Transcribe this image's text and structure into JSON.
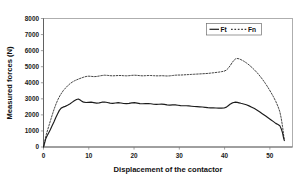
{
  "chart_data": {
    "type": "line",
    "title": "",
    "xlabel": "Displacement of the contactor",
    "ylabel": "Measured forces (N)",
    "xlim": [
      0,
      55
    ],
    "ylim": [
      0,
      8000
    ],
    "xticks": [
      0,
      10,
      20,
      30,
      40,
      50
    ],
    "xtick_labels": [
      "0",
      "10",
      "20",
      "30",
      "40",
      "50"
    ],
    "yticks": [
      0,
      1000,
      2000,
      3000,
      4000,
      5000,
      6000,
      7000,
      8000
    ],
    "ytick_labels": [
      "0",
      "1000",
      "2000",
      "3000",
      "4000",
      "5000",
      "6000",
      "7000",
      "8000"
    ],
    "grid": false,
    "legend_position": "top-right",
    "series": [
      {
        "name": "Ft",
        "style": "solid",
        "color": "#1c1c1c",
        "points": [
          [
            0.0,
            0
          ],
          [
            0.25,
            240
          ],
          [
            0.5,
            520
          ],
          [
            0.8,
            700
          ],
          [
            1.1,
            860
          ],
          [
            1.5,
            1080
          ],
          [
            1.9,
            1320
          ],
          [
            2.3,
            1560
          ],
          [
            2.7,
            1820
          ],
          [
            3.1,
            2060
          ],
          [
            3.5,
            2280
          ],
          [
            3.9,
            2420
          ],
          [
            4.3,
            2480
          ],
          [
            4.8,
            2530
          ],
          [
            5.3,
            2600
          ],
          [
            5.8,
            2680
          ],
          [
            6.3,
            2780
          ],
          [
            6.8,
            2880
          ],
          [
            7.3,
            2960
          ],
          [
            7.7,
            2990
          ],
          [
            8.1,
            2930
          ],
          [
            8.5,
            2840
          ],
          [
            8.9,
            2790
          ],
          [
            9.4,
            2770
          ],
          [
            9.9,
            2780
          ],
          [
            10.5,
            2790
          ],
          [
            11.1,
            2760
          ],
          [
            11.7,
            2730
          ],
          [
            12.3,
            2750
          ],
          [
            12.9,
            2790
          ],
          [
            13.5,
            2800
          ],
          [
            14.1,
            2770
          ],
          [
            14.7,
            2730
          ],
          [
            15.3,
            2720
          ],
          [
            15.9,
            2740
          ],
          [
            16.5,
            2760
          ],
          [
            17.1,
            2740
          ],
          [
            17.7,
            2710
          ],
          [
            18.3,
            2700
          ],
          [
            18.9,
            2720
          ],
          [
            19.5,
            2750
          ],
          [
            20.1,
            2760
          ],
          [
            20.7,
            2730
          ],
          [
            21.3,
            2700
          ],
          [
            21.9,
            2690
          ],
          [
            22.5,
            2700
          ],
          [
            23.1,
            2710
          ],
          [
            23.7,
            2690
          ],
          [
            24.3,
            2660
          ],
          [
            24.9,
            2650
          ],
          [
            25.5,
            2660
          ],
          [
            26.1,
            2670
          ],
          [
            26.7,
            2650
          ],
          [
            27.3,
            2620
          ],
          [
            27.9,
            2610
          ],
          [
            28.5,
            2620
          ],
          [
            29.1,
            2620
          ],
          [
            29.7,
            2600
          ],
          [
            30.3,
            2580
          ],
          [
            30.9,
            2570
          ],
          [
            31.5,
            2570
          ],
          [
            32.1,
            2560
          ],
          [
            32.7,
            2540
          ],
          [
            33.3,
            2520
          ],
          [
            33.9,
            2510
          ],
          [
            34.5,
            2500
          ],
          [
            35.1,
            2490
          ],
          [
            35.7,
            2470
          ],
          [
            36.3,
            2450
          ],
          [
            36.9,
            2440
          ],
          [
            37.5,
            2440
          ],
          [
            38.1,
            2430
          ],
          [
            38.7,
            2420
          ],
          [
            39.3,
            2420
          ],
          [
            39.9,
            2430
          ],
          [
            40.4,
            2480
          ],
          [
            40.8,
            2570
          ],
          [
            41.2,
            2660
          ],
          [
            41.6,
            2730
          ],
          [
            42.0,
            2770
          ],
          [
            42.4,
            2790
          ],
          [
            42.8,
            2780
          ],
          [
            43.2,
            2750
          ],
          [
            43.6,
            2720
          ],
          [
            44.2,
            2680
          ],
          [
            44.8,
            2630
          ],
          [
            45.4,
            2560
          ],
          [
            46.0,
            2480
          ],
          [
            46.6,
            2390
          ],
          [
            47.2,
            2290
          ],
          [
            47.8,
            2180
          ],
          [
            48.4,
            2060
          ],
          [
            49.0,
            1940
          ],
          [
            49.6,
            1820
          ],
          [
            50.2,
            1700
          ],
          [
            50.8,
            1580
          ],
          [
            51.3,
            1470
          ],
          [
            51.8,
            1400
          ],
          [
            52.2,
            1330
          ],
          [
            52.5,
            1140
          ],
          [
            52.8,
            880
          ],
          [
            53.0,
            600
          ],
          [
            53.2,
            400
          ]
        ]
      },
      {
        "name": "Fn",
        "style": "dashed",
        "color": "#3a3a3a",
        "points": [
          [
            0.0,
            0
          ],
          [
            0.3,
            380
          ],
          [
            0.6,
            760
          ],
          [
            0.9,
            1050
          ],
          [
            1.2,
            1330
          ],
          [
            1.6,
            1700
          ],
          [
            2.0,
            2060
          ],
          [
            2.4,
            2400
          ],
          [
            2.8,
            2700
          ],
          [
            3.2,
            2960
          ],
          [
            3.6,
            3180
          ],
          [
            4.0,
            3360
          ],
          [
            4.4,
            3520
          ],
          [
            4.9,
            3680
          ],
          [
            5.4,
            3830
          ],
          [
            5.9,
            3950
          ],
          [
            6.4,
            4050
          ],
          [
            6.9,
            4130
          ],
          [
            7.4,
            4190
          ],
          [
            7.9,
            4250
          ],
          [
            8.4,
            4300
          ],
          [
            8.9,
            4350
          ],
          [
            9.4,
            4390
          ],
          [
            9.9,
            4410
          ],
          [
            10.5,
            4400
          ],
          [
            11.1,
            4380
          ],
          [
            11.7,
            4390
          ],
          [
            12.3,
            4420
          ],
          [
            12.9,
            4450
          ],
          [
            13.5,
            4470
          ],
          [
            14.1,
            4460
          ],
          [
            14.7,
            4440
          ],
          [
            15.3,
            4430
          ],
          [
            15.9,
            4440
          ],
          [
            16.5,
            4450
          ],
          [
            17.1,
            4450
          ],
          [
            17.7,
            4440
          ],
          [
            18.3,
            4430
          ],
          [
            18.9,
            4440
          ],
          [
            19.5,
            4460
          ],
          [
            20.1,
            4470
          ],
          [
            20.7,
            4460
          ],
          [
            21.3,
            4440
          ],
          [
            21.9,
            4430
          ],
          [
            22.5,
            4440
          ],
          [
            23.1,
            4450
          ],
          [
            23.7,
            4450
          ],
          [
            24.3,
            4440
          ],
          [
            24.9,
            4430
          ],
          [
            25.5,
            4430
          ],
          [
            26.1,
            4440
          ],
          [
            26.7,
            4430
          ],
          [
            27.3,
            4420
          ],
          [
            27.9,
            4430
          ],
          [
            28.5,
            4450
          ],
          [
            29.1,
            4470
          ],
          [
            29.7,
            4480
          ],
          [
            30.3,
            4480
          ],
          [
            30.9,
            4490
          ],
          [
            31.5,
            4500
          ],
          [
            32.1,
            4510
          ],
          [
            32.7,
            4520
          ],
          [
            33.3,
            4530
          ],
          [
            33.9,
            4540
          ],
          [
            34.5,
            4550
          ],
          [
            35.1,
            4560
          ],
          [
            35.7,
            4570
          ],
          [
            36.3,
            4580
          ],
          [
            36.9,
            4600
          ],
          [
            37.5,
            4620
          ],
          [
            38.1,
            4640
          ],
          [
            38.7,
            4660
          ],
          [
            39.3,
            4690
          ],
          [
            39.9,
            4720
          ],
          [
            40.4,
            4790
          ],
          [
            40.8,
            4900
          ],
          [
            41.2,
            5050
          ],
          [
            41.6,
            5220
          ],
          [
            42.0,
            5380
          ],
          [
            42.4,
            5480
          ],
          [
            42.8,
            5510
          ],
          [
            43.2,
            5490
          ],
          [
            43.6,
            5440
          ],
          [
            44.2,
            5350
          ],
          [
            44.8,
            5240
          ],
          [
            45.4,
            5110
          ],
          [
            46.0,
            4960
          ],
          [
            46.6,
            4800
          ],
          [
            47.2,
            4620
          ],
          [
            47.8,
            4420
          ],
          [
            48.4,
            4200
          ],
          [
            49.0,
            3960
          ],
          [
            49.6,
            3700
          ],
          [
            50.2,
            3420
          ],
          [
            50.8,
            3120
          ],
          [
            51.3,
            2840
          ],
          [
            51.8,
            2520
          ],
          [
            52.2,
            2200
          ],
          [
            52.5,
            1800
          ],
          [
            52.8,
            1280
          ],
          [
            53.0,
            820
          ],
          [
            53.2,
            420
          ]
        ]
      }
    ]
  },
  "legend": {
    "entries": [
      {
        "label": "Ft",
        "style": "solid"
      },
      {
        "label": "Fn",
        "style": "dashed"
      }
    ]
  }
}
